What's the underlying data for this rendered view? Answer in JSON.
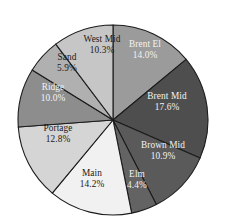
{
  "chart_data": {
    "type": "pie",
    "title": "",
    "subtitle": "",
    "xlabel": "",
    "ylabel": "",
    "grid": false,
    "legend_position": "none",
    "label_format": "name + percent inside slice",
    "start_angle_deg": 0,
    "direction": "clockwise",
    "total_percent": "100.1",
    "categories": [
      "Brent El",
      "Brent Mid",
      "Brown Mid",
      "Elm",
      "Main",
      "Portage",
      "Ridge",
      "Sand",
      "West Mid"
    ],
    "values": [
      14.0,
      17.6,
      10.9,
      4.4,
      14.2,
      12.8,
      10.0,
      5.9,
      10.3
    ],
    "slices": [
      {
        "name": "Brent El",
        "percent": 14.0,
        "percent_label": "14.0%",
        "color": "#9b9b9b",
        "text_color": "light",
        "label_x": 145,
        "label_y": 50
      },
      {
        "name": "Brent Mid",
        "percent": 17.6,
        "percent_label": "17.6%",
        "color": "#4e4e4e",
        "text_color": "light",
        "label_x": 167,
        "label_y": 102
      },
      {
        "name": "Brown Mid",
        "percent": 10.9,
        "percent_label": "10.9%",
        "color": "#5a5a5a",
        "text_color": "light",
        "label_x": 163,
        "label_y": 151
      },
      {
        "name": "Elm",
        "percent": 4.4,
        "percent_label": "4.4%",
        "color": "#636363",
        "text_color": "light",
        "label_x": 137,
        "label_y": 180
      },
      {
        "name": "Main",
        "percent": 14.2,
        "percent_label": "14.2%",
        "color": "#f1f1f1",
        "text_color": "dark",
        "label_x": 92,
        "label_y": 179
      },
      {
        "name": "Portage",
        "percent": 12.8,
        "percent_label": "12.8%",
        "color": "#d5d5d5",
        "text_color": "dark",
        "label_x": 58,
        "label_y": 134
      },
      {
        "name": "Ridge",
        "percent": 10.0,
        "percent_label": "10.0%",
        "color": "#8d8d8d",
        "text_color": "light",
        "label_x": 53,
        "label_y": 93
      },
      {
        "name": "Sand",
        "percent": 5.9,
        "percent_label": "5.9%",
        "color": "#b0b0b0",
        "text_color": "dark",
        "label_x": 67,
        "label_y": 63
      },
      {
        "name": "West Mid",
        "percent": 10.3,
        "percent_label": "10.3%",
        "color": "#c6c6c6",
        "text_color": "dark",
        "label_x": 102,
        "label_y": 45
      }
    ],
    "geometry": {
      "center_x": 113,
      "center_y": 120,
      "radius": 95
    },
    "colors": {
      "background": "#ffffff",
      "slice_border": "#1c1c1c",
      "label_dark": "#1a1a1a",
      "label_light": "#f2f2f2"
    }
  }
}
